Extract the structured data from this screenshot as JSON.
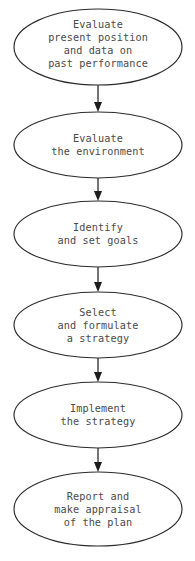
{
  "diagram": {
    "background_color": "#ffffff",
    "stroke_color": "#2b2b2b",
    "text_color": "#4a4a4a",
    "orientation": "vertical top-to-bottom",
    "node_shape": "ellipse",
    "connector": "arrow-down"
  },
  "nodes": [
    {
      "id": "node-1",
      "name": "evaluate-present-position",
      "lines": [
        "Evaluate",
        "present position",
        "and data on",
        "past performance"
      ],
      "cx": 98,
      "cy": 47,
      "rx": 84,
      "ry": 38
    },
    {
      "id": "node-2",
      "name": "evaluate-environment",
      "lines": [
        "Evaluate",
        "the environment"
      ],
      "cx": 98,
      "cy": 145,
      "rx": 84,
      "ry": 33
    },
    {
      "id": "node-3",
      "name": "identify-and-set-goals",
      "lines": [
        "Identify",
        "and set goals"
      ],
      "cx": 98,
      "cy": 234,
      "rx": 84,
      "ry": 33
    },
    {
      "id": "node-4",
      "name": "select-and-formulate-strategy",
      "lines": [
        "Select",
        "and formulate",
        "a strategy"
      ],
      "cx": 98,
      "cy": 325,
      "rx": 84,
      "ry": 33
    },
    {
      "id": "node-5",
      "name": "implement-the-strategy",
      "lines": [
        "Implement",
        "the strategy"
      ],
      "cx": 98,
      "cy": 415,
      "rx": 84,
      "ry": 33
    },
    {
      "id": "node-6",
      "name": "report-and-appraise",
      "lines": [
        "Report and",
        "make appraisal",
        "of the plan"
      ],
      "cx": 98,
      "cy": 509,
      "rx": 84,
      "ry": 37
    }
  ],
  "connectors": [
    {
      "id": "arrow-1",
      "name": "arrow-1-to-2",
      "x": 98,
      "y_start": 85,
      "y_end": 112
    },
    {
      "id": "arrow-2",
      "name": "arrow-2-to-3",
      "x": 98,
      "y_start": 178,
      "y_end": 201
    },
    {
      "id": "arrow-3",
      "name": "arrow-3-to-4",
      "x": 98,
      "y_start": 267,
      "y_end": 292
    },
    {
      "id": "arrow-4",
      "name": "arrow-4-to-5",
      "x": 98,
      "y_start": 358,
      "y_end": 382
    },
    {
      "id": "arrow-5",
      "name": "arrow-5-to-6",
      "x": 98,
      "y_start": 448,
      "y_end": 472
    }
  ],
  "caption": {
    "text": "",
    "visible": false
  }
}
